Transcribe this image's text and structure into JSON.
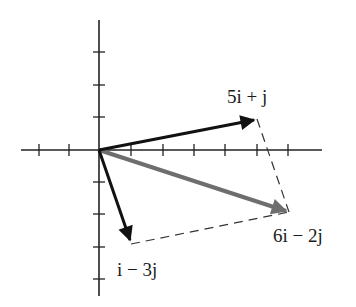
{
  "diagram": {
    "type": "vector-addition",
    "grid_unit_px": 31.5,
    "origin_px": [
      99,
      150
    ],
    "axes": {
      "x_range": [
        -2.5,
        7.0
      ],
      "y_range": [
        -4.6,
        4.6
      ],
      "x_ticks": [
        -2,
        -1,
        1,
        2,
        3,
        4,
        5,
        6
      ],
      "y_ticks": [
        -4,
        -3,
        -2,
        -1,
        1,
        2,
        3
      ]
    },
    "vectors": [
      {
        "name": "u",
        "label": "5i + j",
        "components": [
          5,
          1
        ],
        "color": "#111111"
      },
      {
        "name": "v",
        "label": "i − 3j",
        "components": [
          1,
          -3
        ],
        "color": "#111111"
      },
      {
        "name": "sum",
        "label": "6i − 2j",
        "components": [
          6,
          -2
        ],
        "color": "#6e6e6e"
      }
    ],
    "parallelogram": {
      "style": "dashed",
      "color": "#333333"
    }
  }
}
